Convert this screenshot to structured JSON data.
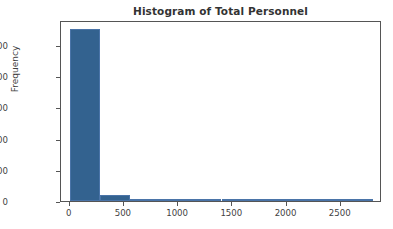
{
  "figure": {
    "width": 393,
    "height": 229,
    "background": "#ffffff",
    "axes_edge_color": "#555555"
  },
  "chart_data": {
    "type": "bar",
    "title": "Histogram of Total Personnel",
    "xlabel": "",
    "ylabel": "Frequency",
    "xlim": [
      -80,
      2880
    ],
    "ylim": [
      0,
      5800
    ],
    "grid": false,
    "legend": null,
    "bar_color": "#33628f",
    "bar_edge_color": "#4a74a8",
    "bin_width": 280,
    "bin_edges": [
      0,
      280,
      560,
      840,
      1120,
      1400,
      1680,
      1960,
      2240,
      2520,
      2800
    ],
    "categories": [
      "0-280",
      "280-560",
      "560-840",
      "840-1120",
      "1120-1400",
      "1400-1680",
      "1680-1960",
      "1960-2240",
      "2240-2520",
      "2520-2800"
    ],
    "values": [
      5500,
      190,
      70,
      25,
      10,
      5,
      3,
      2,
      1,
      1
    ],
    "x": [
      140,
      420,
      700,
      980,
      1260,
      1540,
      1820,
      2100,
      2380,
      2660
    ],
    "xticks": [
      0,
      500,
      1000,
      1500,
      2000,
      2500
    ],
    "xticklabels": [
      "0",
      "500",
      "1000",
      "1500",
      "2000",
      "2500"
    ],
    "yticks": [
      0,
      1000,
      2000,
      3000,
      4000,
      5000
    ],
    "yticklabels": [
      "0",
      "1000",
      "2000",
      "3000",
      "4000",
      "5000"
    ]
  }
}
